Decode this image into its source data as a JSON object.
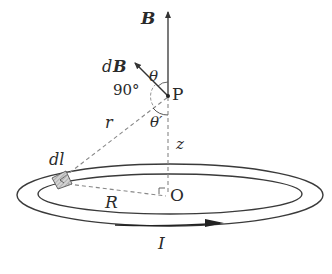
{
  "diagram": {
    "labels": {
      "B": "B",
      "dB_prefix": "d",
      "dB_vec": "B",
      "theta": "θ",
      "right_angle": "90°",
      "point_P": "P",
      "r": "r",
      "theta_prime": "θ′",
      "z": "z",
      "dl": "dl",
      "R": "R",
      "origin_O": "O",
      "current_I": "I"
    },
    "colors": {
      "line": "#3a3a3a",
      "dashed": "#888888",
      "element_fill": "#bbbbbb",
      "background": "#ffffff"
    },
    "elements": [
      {
        "id": "B-vector",
        "from": "P",
        "direction": "up along axis"
      },
      {
        "id": "dB-vector",
        "from": "P",
        "direction": "up-left, perpendicular to r"
      },
      {
        "id": "r-line",
        "from": "dl",
        "to": "P",
        "style": "dashed"
      },
      {
        "id": "z-axis",
        "from": "P",
        "to": "O",
        "style": "dashed"
      },
      {
        "id": "R-line",
        "from": "dl",
        "to": "O",
        "style": "dashed"
      },
      {
        "id": "current-loop",
        "shape": "ring (ellipse in perspective)"
      },
      {
        "id": "current-arrow",
        "direction": "left-to-right along front of ring"
      }
    ]
  }
}
